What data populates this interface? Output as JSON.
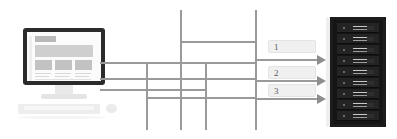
{
  "diagram": {
    "workstation": {
      "name": "client-workstation",
      "screen_elements": [
        "logo-block",
        "banner-block",
        "column-block-1",
        "column-block-2",
        "column-block-3"
      ]
    },
    "labels": [
      {
        "id": "label-1",
        "text": "1"
      },
      {
        "id": "label-2",
        "text": "2"
      },
      {
        "id": "label-3",
        "text": "3"
      }
    ],
    "arrows": [
      {
        "id": "arrow-1",
        "direction": "right"
      },
      {
        "id": "arrow-2",
        "direction": "right"
      },
      {
        "id": "arrow-3",
        "direction": "right"
      }
    ],
    "server_rack": {
      "name": "server-rack",
      "unit_count": 9
    },
    "colors": {
      "line": "#9a9a9a",
      "arrow": "#8e8e8e",
      "label_bg": "#f0f0f0",
      "label_border": "#e3e3e3",
      "label_text": "#5a5a5a",
      "rack_body": "#151515",
      "rack_unit": "#242424",
      "monitor_frame": "#2b2b2b",
      "screen_bg": "#fbfbfb",
      "background": "#ffffff"
    }
  }
}
